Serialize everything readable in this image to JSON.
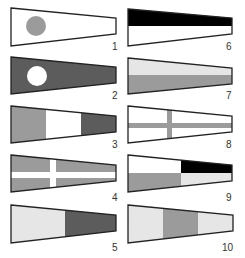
{
  "colors": {
    "white": "#ffffff",
    "light_gray": "#e6e6e6",
    "mid_gray": "#9b9b9b",
    "dark_gray": "#5c5c5c",
    "black": "#000000",
    "outline": "#222222"
  },
  "flags": [
    {
      "number": "1",
      "design": "white pennant with mid-gray circle"
    },
    {
      "number": "2",
      "design": "dark-gray pennant with white circle"
    },
    {
      "number": "3",
      "design": "vertical stripes: mid-gray, white, dark-gray"
    },
    {
      "number": "4",
      "design": "mid-gray with white cross"
    },
    {
      "number": "5",
      "design": "vertical halves: light-gray, dark-gray"
    },
    {
      "number": "6",
      "design": "horizontal halves: black over white"
    },
    {
      "number": "7",
      "design": "horizontal halves: light-gray over mid-gray"
    },
    {
      "number": "8",
      "design": "white with mid-gray cross"
    },
    {
      "number": "9",
      "design": "quartered: white, black / mid-gray, light-gray"
    },
    {
      "number": "10",
      "design": "vertical stripes: light-gray, mid-gray, light-gray"
    }
  ]
}
